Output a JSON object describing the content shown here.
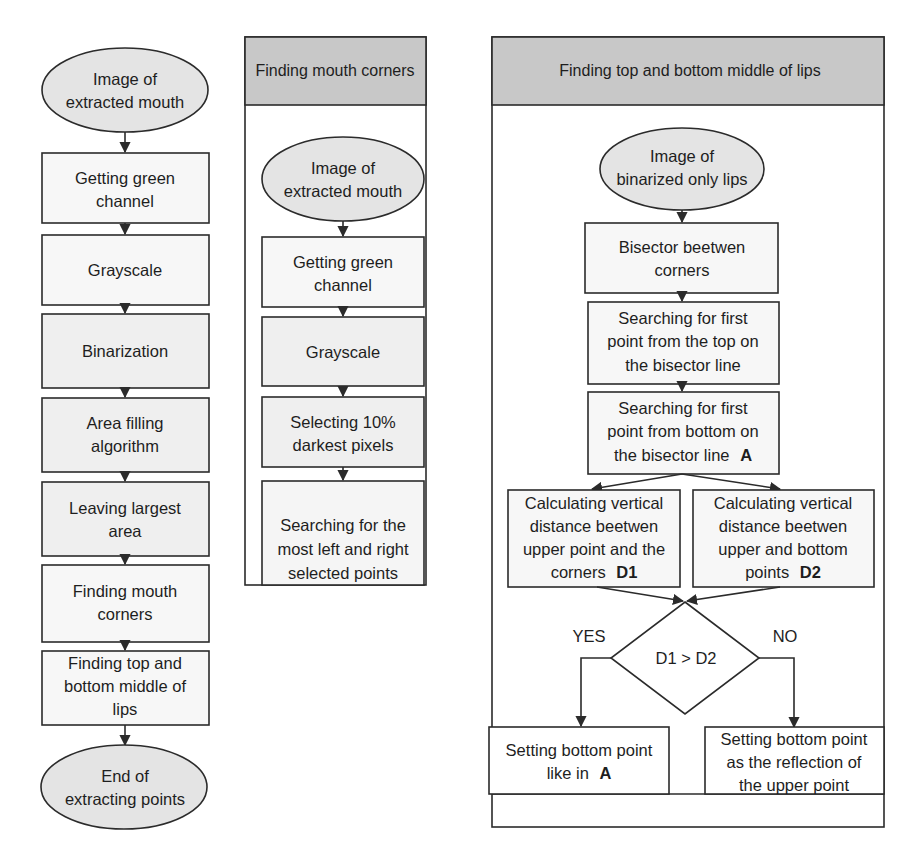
{
  "colors": {
    "stroke": "#2b2b2b",
    "terminal_fill": "#e4e4e4",
    "process_fill": "#f4f4f4",
    "header_fill": "#c8c8c8",
    "background": "#ffffff"
  },
  "left_flow": {
    "start": [
      "Image of",
      "extracted mouth"
    ],
    "steps": [
      [
        "Getting green",
        "channel"
      ],
      [
        "Grayscale"
      ],
      [
        "Binarization"
      ],
      [
        "Area filling",
        "algorithm"
      ],
      [
        "Leaving largest",
        "area"
      ],
      [
        "Finding mouth",
        "corners"
      ],
      [
        "Finding top and",
        "bottom middle of",
        "lips"
      ]
    ],
    "end": [
      "End of",
      "extracting points"
    ]
  },
  "mouth_corners_panel": {
    "title": "Finding mouth corners",
    "start": [
      "Image of",
      "extracted mouth"
    ],
    "steps": [
      [
        "Getting green",
        "channel"
      ],
      [
        "Grayscale"
      ],
      [
        "Selecting 10%",
        "darkest pixels"
      ],
      [
        "Searching for the",
        "most left and right",
        "selected points"
      ]
    ]
  },
  "lips_panel": {
    "title": "Finding top and bottom middle of lips",
    "start": [
      "Image of",
      "binarized only lips"
    ],
    "steps": [
      [
        "Bisector beetwen",
        "corners"
      ],
      [
        "Searching for first",
        "point from the top on",
        "the bisector line"
      ],
      [
        "Searching for first",
        "point from bottom on",
        "the bisector line"
      ]
    ],
    "step3_marker": "A",
    "branch_left": [
      "Calculating vertical",
      "distance beetwen",
      "upper point and the",
      "corners"
    ],
    "branch_left_marker": "D1",
    "branch_right": [
      "Calculating vertical",
      "distance beetwen",
      "upper and bottom",
      "points"
    ],
    "branch_right_marker": "D2",
    "decision": "D1 > D2",
    "yes_label": "YES",
    "no_label": "NO",
    "yes_result": [
      "Setting bottom point",
      "like in"
    ],
    "yes_result_marker": "A",
    "no_result": [
      "Setting bottom point",
      "as the reflection of",
      "the upper point"
    ]
  }
}
